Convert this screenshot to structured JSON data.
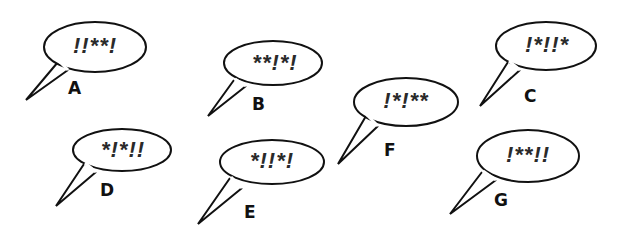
{
  "bubbles": [
    {
      "label": "A",
      "text": "!!**!"
    },
    {
      "label": "B",
      "text": "**!*!"
    },
    {
      "label": "C",
      "text": "!*!!*"
    },
    {
      "label": "D",
      "text": "*!*!!"
    },
    {
      "label": "E",
      "text": "*!!*!"
    },
    {
      "label": "F",
      "text": "!*!**"
    },
    {
      "label": "G",
      "text": "!**!!"
    }
  ]
}
